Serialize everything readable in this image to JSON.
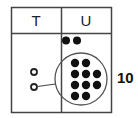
{
  "diagram": {
    "type": "place-value-chart",
    "columns": [
      {
        "key": "tens",
        "header": "T"
      },
      {
        "key": "ones",
        "header": "U"
      }
    ],
    "ones_column": {
      "loose_counters": 2,
      "grouped_counters": 10,
      "group_rows": [
        2,
        3,
        3,
        2
      ]
    },
    "tens_column": {
      "hollow_counters": 2
    },
    "group_label": "10",
    "colors": {
      "line": "#444444",
      "counter_fill": "#111111",
      "circle_stroke": "#555555"
    }
  }
}
